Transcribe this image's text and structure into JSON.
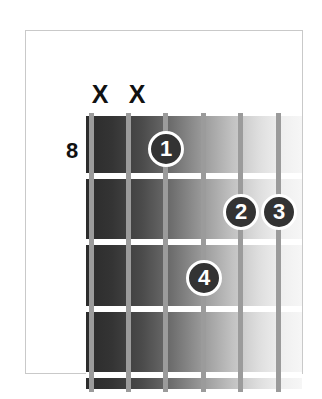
{
  "diagram": {
    "type": "guitar-chord-diagram",
    "title": "",
    "start_fret_label": "8",
    "string_count": 6,
    "fret_count": 5,
    "string_markers": [
      {
        "string": 1,
        "symbol": "X",
        "meaning": "muted"
      },
      {
        "string": 2,
        "symbol": "X",
        "meaning": "muted"
      },
      {
        "string": 3,
        "symbol": "",
        "meaning": "fretted"
      },
      {
        "string": 4,
        "symbol": "",
        "meaning": "fretted"
      },
      {
        "string": 5,
        "symbol": "",
        "meaning": "fretted"
      },
      {
        "string": 6,
        "symbol": "",
        "meaning": "fretted"
      }
    ],
    "fingerings": [
      {
        "label": "1",
        "string": 3,
        "fret": 1
      },
      {
        "label": "2",
        "string": 5,
        "fret": 2
      },
      {
        "label": "3",
        "string": 6,
        "fret": 2
      },
      {
        "label": "4",
        "string": 4,
        "fret": 3
      }
    ],
    "colors": {
      "card_background": "#ffffff",
      "card_border": "#c9c9c9",
      "fretboard_dark": "#2b2b2b",
      "fretboard_light": "#f6f6f6",
      "string": "#9b9b9b",
      "fret_line": "#ffffff",
      "dot_fill": "#333333",
      "dot_text": "#ffffff",
      "label_text": "#111111"
    },
    "geometry": {
      "string_x": [
        3,
        40,
        77,
        115,
        152,
        190
      ],
      "fret_y": [
        57,
        123,
        190,
        256
      ],
      "mute_x": [
        14,
        51
      ]
    }
  }
}
